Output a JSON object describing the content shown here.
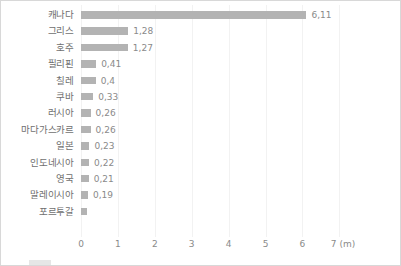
{
  "chart_data": {
    "type": "bar",
    "orientation": "horizontal",
    "title": "",
    "subtitle": "",
    "xlabel": "(m)",
    "ylabel": "",
    "xlim": [
      0,
      7
    ],
    "grid": true,
    "legend": null,
    "decimal_separator": ",",
    "unit": "(m)",
    "categories": [
      "캐나다",
      "그리스",
      "호주",
      "필리핀",
      "칠레",
      "쿠바",
      "러시아",
      "마다가스카르",
      "일본",
      "인도네시아",
      "영국",
      "말레이시아",
      "포르투갈"
    ],
    "values": [
      6.11,
      1.28,
      1.27,
      0.41,
      0.4,
      0.33,
      0.26,
      0.26,
      0.23,
      0.22,
      0.21,
      0.19,
      0.17
    ],
    "value_labels": [
      "6,11",
      "1,28",
      "1,27",
      "0,41",
      "0,4",
      "0,33",
      "0,26",
      "0,26",
      "0,23",
      "0,22",
      "0,21",
      "0,19",
      ""
    ],
    "xticks": [
      0,
      1,
      2,
      3,
      4,
      5,
      6,
      7
    ],
    "xtick_labels": [
      "0",
      "1",
      "2",
      "3",
      "4",
      "5",
      "6",
      "7"
    ],
    "bar_color": "#b3b3b3",
    "label_color": "#6f6f6f",
    "value_color": "#8a8a8a",
    "gridline_color": "#f2f2f2",
    "background_color": "#ffffff",
    "border_color": "#d8d8d8"
  },
  "axis": {
    "unit_label": "(m)"
  }
}
